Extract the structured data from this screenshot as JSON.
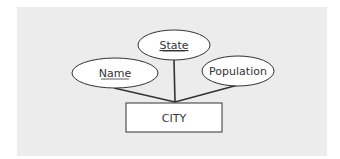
{
  "diagram": {
    "type": "ER diagram",
    "entity": {
      "label": "CITY"
    },
    "attributes": [
      {
        "label": "State",
        "key": true
      },
      {
        "label": "Name",
        "key": true
      },
      {
        "label": "Population",
        "key": false
      }
    ],
    "colors": {
      "background": "#ececec",
      "shape_fill": "#ffffff",
      "stroke": "#333333",
      "text": "#333333"
    }
  }
}
